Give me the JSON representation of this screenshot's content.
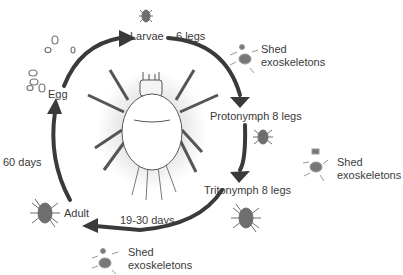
{
  "diagram": {
    "colors": {
      "arrow": "#3a3a3a",
      "mite_fill": "#6e6e6e",
      "body_fill": "#ffffff",
      "text": "#3a3a3a"
    },
    "stages": [
      {
        "label": "Egg"
      },
      {
        "label": "Larvae",
        "legs": "6 legs"
      },
      {
        "label": "Protonymph 8 legs"
      },
      {
        "label": "Tritonymph 8 legs"
      },
      {
        "label": "Adult"
      }
    ],
    "durations": [
      {
        "label": "60 days"
      },
      {
        "label": "19-30 days"
      }
    ],
    "shed": [
      {
        "line1": "Shed",
        "line2": "exoskeletons"
      },
      {
        "line1": "Shed",
        "line2": "exoskeletons"
      },
      {
        "line1": "Shed",
        "line2": "exoskeletons"
      }
    ]
  }
}
